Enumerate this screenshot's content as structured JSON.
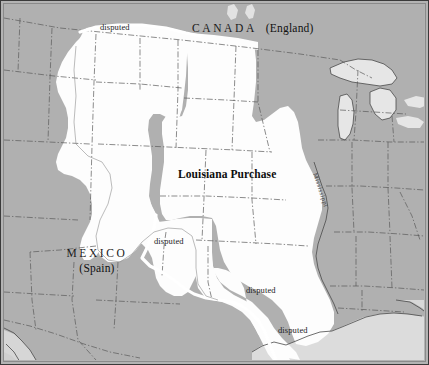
{
  "map": {
    "title": "Louisiana Purchase territory map",
    "colors": {
      "land": "#b0b0b0",
      "territory_fill": "#fdfdfd",
      "water": "#d8d8d8",
      "border_line": "#555555",
      "disputed_line": "#ffffff",
      "frame": "#3a3a3a",
      "text": "#111111"
    },
    "labels": {
      "canada": "CANADA",
      "canada_power": "(England)",
      "mexico": "MEXICO",
      "mexico_power": "(Spain)",
      "territory": "Louisiana Purchase",
      "river": "Mississippi",
      "disputed_north": "disputed",
      "disputed_west": "disputed",
      "disputed_south": "disputed",
      "disputed_gulf": "disputed"
    }
  }
}
